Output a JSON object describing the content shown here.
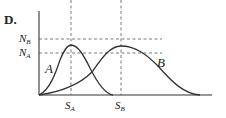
{
  "option_label": "D.",
  "axis": {
    "y_ticks": [
      {
        "main": "N",
        "sub": "B"
      },
      {
        "main": "N",
        "sub": "A"
      }
    ],
    "x_ticks": [
      {
        "main": "S",
        "sub": "A"
      },
      {
        "main": "S",
        "sub": "B"
      }
    ]
  },
  "curves": [
    {
      "name": "A",
      "peak_x": "S_A",
      "peak_y": "between N_A and N_B"
    },
    {
      "name": "B",
      "peak_x": "S_B",
      "peak_y": "between N_A and N_B"
    }
  ],
  "colors": {
    "line": "#333333",
    "dashed": "#555555"
  }
}
